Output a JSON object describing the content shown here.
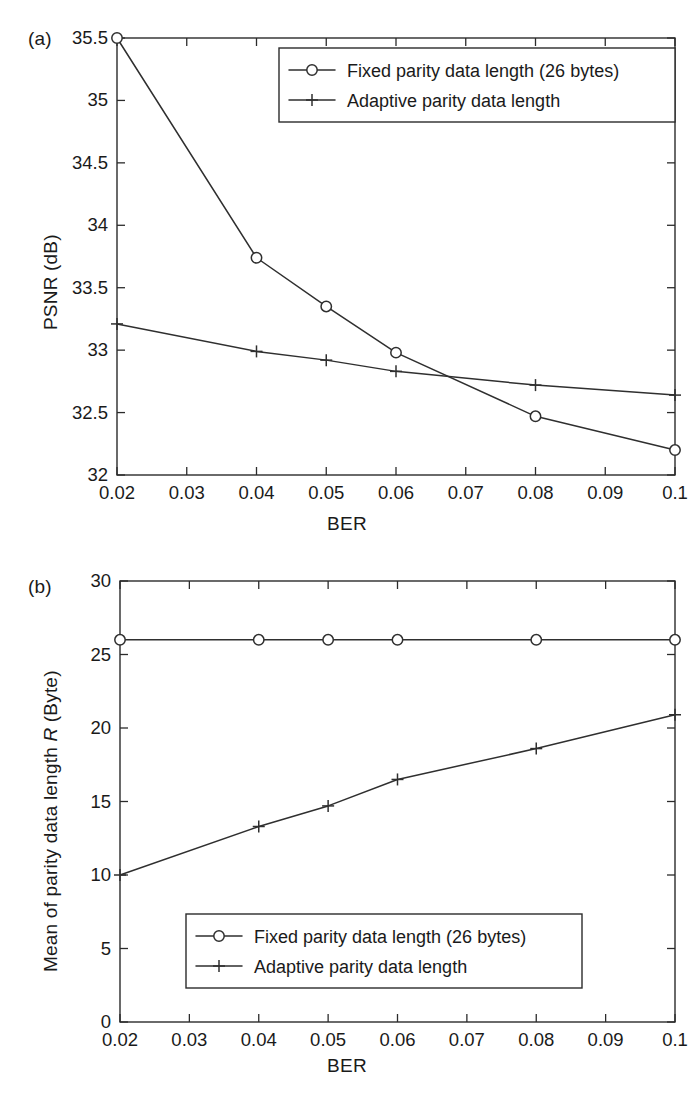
{
  "figure": {
    "panel_a_label": "(a)",
    "panel_b_label": "(b)"
  },
  "chart_data": [
    {
      "id": "panel-a",
      "type": "line",
      "title": "",
      "panel": "(a)",
      "xlabel": "BER",
      "ylabel": "PSNR (dB)",
      "x": [
        0.02,
        0.04,
        0.05,
        0.06,
        0.08,
        0.1
      ],
      "xlim": [
        0.02,
        0.1
      ],
      "ylim": [
        32,
        35.5
      ],
      "xticks": [
        0.02,
        0.03,
        0.04,
        0.05,
        0.06,
        0.07,
        0.08,
        0.09,
        0.1
      ],
      "xticklabels": [
        "0.02",
        "0.03",
        "0.04",
        "0.05",
        "0.06",
        "0.07",
        "0.08",
        "0.09",
        "0.1"
      ],
      "yticks": [
        32,
        32.5,
        33,
        33.5,
        34,
        34.5,
        35,
        35.5
      ],
      "yticklabels": [
        "32",
        "32.5",
        "33",
        "33.5",
        "34",
        "34.5",
        "35",
        "35.5"
      ],
      "grid": false,
      "legend_position": "top-right-inside",
      "series": [
        {
          "name": "Fixed parity data length (26 bytes)",
          "marker": "circle",
          "values": [
            35.5,
            33.74,
            33.35,
            32.98,
            32.47,
            32.2
          ]
        },
        {
          "name": "Adaptive parity data length",
          "marker": "plus",
          "values": [
            33.21,
            32.99,
            32.92,
            32.83,
            32.72,
            32.64
          ]
        }
      ]
    },
    {
      "id": "panel-b",
      "type": "line",
      "title": "",
      "panel": "(b)",
      "xlabel": "BER",
      "ylabel": "Mean of parity data length R (Byte)",
      "ylabel_italic_part": "R",
      "x": [
        0.02,
        0.04,
        0.05,
        0.06,
        0.08,
        0.1
      ],
      "xlim": [
        0.02,
        0.1
      ],
      "ylim": [
        0,
        30
      ],
      "xticks": [
        0.02,
        0.03,
        0.04,
        0.05,
        0.06,
        0.07,
        0.08,
        0.09,
        0.1
      ],
      "xticklabels": [
        "0.02",
        "0.03",
        "0.04",
        "0.05",
        "0.06",
        "0.07",
        "0.08",
        "0.09",
        "0.1"
      ],
      "yticks": [
        0,
        5,
        10,
        15,
        20,
        25,
        30
      ],
      "yticklabels": [
        "0",
        "5",
        "10",
        "15",
        "20",
        "25",
        "30"
      ],
      "grid": false,
      "legend_position": "bottom-right-inside",
      "series": [
        {
          "name": "Fixed parity data length (26 bytes)",
          "marker": "circle",
          "values": [
            26,
            26,
            26,
            26,
            26,
            26
          ]
        },
        {
          "name": "Adaptive parity data length",
          "marker": "plus",
          "values": [
            10.0,
            13.3,
            14.7,
            16.5,
            18.6,
            20.9
          ]
        }
      ]
    }
  ],
  "colors": {
    "ink": "#2f2f2f",
    "background": "#ffffff"
  }
}
